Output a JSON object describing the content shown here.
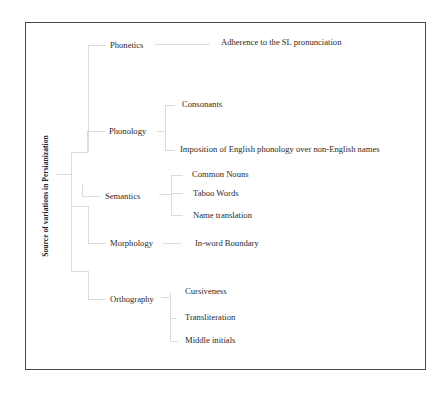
{
  "diagram": {
    "type": "tree",
    "root": {
      "label": "Source of variations in Persianization"
    },
    "categories": [
      {
        "label": "Phonetics",
        "children": [
          "Adherence to the SL pronunciation"
        ]
      },
      {
        "label": "Phonology",
        "children": [
          "Consonants",
          "Imposition of English phonology over non-English names"
        ]
      },
      {
        "label": "Semantics",
        "children": [
          "Common Nouns",
          "Taboo Words",
          "Name translation"
        ]
      },
      {
        "label": "Morphology",
        "children": [
          "In-word Boundary"
        ]
      },
      {
        "label": "Orthography",
        "children": [
          "Cursiveness",
          "Transliteration",
          "Middle initials"
        ]
      }
    ]
  },
  "colors": {
    "frame": "#4a4a4a",
    "connector": "#dcdcdc",
    "text": "#2a2a2a"
  }
}
